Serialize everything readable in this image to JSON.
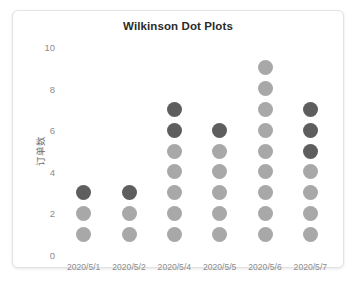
{
  "card": {
    "background": "#ffffff",
    "border_color": "#e3e3e3"
  },
  "chart_data": {
    "type": "scatter",
    "subtype": "wilkinson-dot-plot",
    "title": "Wilkinson Dot Plots",
    "xlabel": "",
    "ylabel": "订单数",
    "ylim": [
      0,
      10
    ],
    "yticks": [
      0,
      2,
      4,
      6,
      8,
      10
    ],
    "ytick_labels": [
      "0",
      "2",
      "4",
      "6",
      "8",
      "10"
    ],
    "grid": false,
    "legend": "none",
    "dot_colors": {
      "normal": "#a8a8a8",
      "highlight": "#5e5e5e"
    },
    "categories": [
      "2020/5/1",
      "2020/5/2",
      "2020/5/4",
      "2020/5/5",
      "2020/5/6",
      "2020/5/7"
    ],
    "values": [
      3,
      3,
      7,
      6,
      9,
      7
    ],
    "columns": [
      {
        "category": "2020/5/1",
        "count": 3,
        "dots": [
          {
            "value": 1,
            "color": "#a8a8a8"
          },
          {
            "value": 2,
            "color": "#a8a8a8"
          },
          {
            "value": 3,
            "color": "#5e5e5e"
          }
        ]
      },
      {
        "category": "2020/5/2",
        "count": 3,
        "dots": [
          {
            "value": 1,
            "color": "#a8a8a8"
          },
          {
            "value": 2,
            "color": "#a8a8a8"
          },
          {
            "value": 3,
            "color": "#5e5e5e"
          }
        ]
      },
      {
        "category": "2020/5/4",
        "count": 7,
        "dots": [
          {
            "value": 1,
            "color": "#a8a8a8"
          },
          {
            "value": 2,
            "color": "#a8a8a8"
          },
          {
            "value": 3,
            "color": "#a8a8a8"
          },
          {
            "value": 4,
            "color": "#a8a8a8"
          },
          {
            "value": 5,
            "color": "#a8a8a8"
          },
          {
            "value": 6,
            "color": "#5e5e5e"
          },
          {
            "value": 7,
            "color": "#5e5e5e"
          }
        ]
      },
      {
        "category": "2020/5/5",
        "count": 6,
        "dots": [
          {
            "value": 1,
            "color": "#a8a8a8"
          },
          {
            "value": 2,
            "color": "#a8a8a8"
          },
          {
            "value": 3,
            "color": "#a8a8a8"
          },
          {
            "value": 4,
            "color": "#a8a8a8"
          },
          {
            "value": 5,
            "color": "#a8a8a8"
          },
          {
            "value": 6,
            "color": "#5e5e5e"
          }
        ]
      },
      {
        "category": "2020/5/6",
        "count": 9,
        "dots": [
          {
            "value": 1,
            "color": "#a8a8a8"
          },
          {
            "value": 2,
            "color": "#a8a8a8"
          },
          {
            "value": 3,
            "color": "#a8a8a8"
          },
          {
            "value": 4,
            "color": "#a8a8a8"
          },
          {
            "value": 5,
            "color": "#a8a8a8"
          },
          {
            "value": 6,
            "color": "#a8a8a8"
          },
          {
            "value": 7,
            "color": "#a8a8a8"
          },
          {
            "value": 8,
            "color": "#a8a8a8"
          },
          {
            "value": 9,
            "color": "#a8a8a8"
          }
        ]
      },
      {
        "category": "2020/5/7",
        "count": 7,
        "dots": [
          {
            "value": 1,
            "color": "#a8a8a8"
          },
          {
            "value": 2,
            "color": "#a8a8a8"
          },
          {
            "value": 3,
            "color": "#a8a8a8"
          },
          {
            "value": 4,
            "color": "#a8a8a8"
          },
          {
            "value": 5,
            "color": "#5e5e5e"
          },
          {
            "value": 6,
            "color": "#5e5e5e"
          },
          {
            "value": 7,
            "color": "#5e5e5e"
          }
        ]
      }
    ]
  }
}
